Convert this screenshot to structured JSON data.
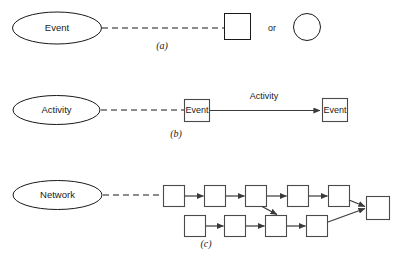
{
  "figure": {
    "background_color": "#ffffff",
    "line_color": "#1a1a1a",
    "box_stroke_color": "#4a4a4a",
    "arrow_color": "#3a3a3a"
  },
  "panels": [
    {
      "caption": "(a)",
      "ellipse_label": "Event",
      "node_labels": [],
      "or_text": "or",
      "alternates": [
        "square",
        "circle"
      ]
    },
    {
      "caption": "(b)",
      "ellipse_label": "Activity",
      "node_labels": [
        "Event",
        "Event"
      ],
      "edge_label": "Activity"
    },
    {
      "caption": "(c)",
      "ellipse_label": "Network",
      "top_row_count": 5,
      "bottom_row_count": 4,
      "terminal_count": 1
    }
  ],
  "panel_a": {
    "ellipse_label": "Event",
    "caption": "(a)",
    "or_text": "or"
  },
  "panel_b": {
    "ellipse_label": "Activity",
    "caption": "(b)",
    "event_1": "Event",
    "event_2": "Event",
    "activity_edge_label": "Activity"
  },
  "panel_c": {
    "ellipse_label": "Network",
    "caption": "(c)"
  }
}
